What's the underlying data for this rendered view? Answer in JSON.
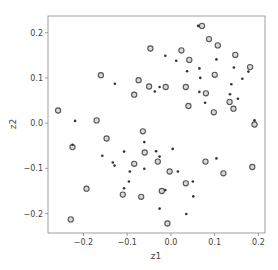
{
  "chart_data": {
    "type": "scatter",
    "title": "",
    "xlabel": "z1",
    "ylabel": "z2",
    "xlim": [
      -0.281,
      0.215
    ],
    "ylim": [
      -0.243,
      0.237
    ],
    "grid": false,
    "legend": null,
    "xticks": [
      -0.2,
      -0.1,
      0.0,
      0.1,
      0.2
    ],
    "xtick_labels": [
      "−0.2",
      "−0.1",
      "0.0",
      "0.1",
      "0.2"
    ],
    "yticks": [
      -0.2,
      -0.1,
      0.0,
      0.1,
      0.2
    ],
    "ytick_labels": [
      "−0.2",
      "−0.1",
      "0.0",
      "0.1",
      "0.2"
    ],
    "series": [
      {
        "name": "open-circles",
        "marker": "o",
        "style": "hollow",
        "points": [
          [
            -0.258,
            0.028
          ],
          [
            -0.16,
            0.106
          ],
          [
            -0.17,
            0.006
          ],
          [
            -0.147,
            -0.034
          ],
          [
            -0.225,
            -0.053
          ],
          [
            -0.193,
            -0.145
          ],
          [
            -0.229,
            -0.213
          ],
          [
            -0.084,
            0.063
          ],
          [
            -0.074,
            0.095
          ],
          [
            -0.05,
            0.081
          ],
          [
            -0.047,
            0.165
          ],
          [
            -0.012,
            0.08
          ],
          [
            -0.064,
            -0.018
          ],
          [
            -0.06,
            -0.065
          ],
          [
            -0.084,
            -0.09
          ],
          [
            -0.03,
            -0.085
          ],
          [
            -0.003,
            -0.107
          ],
          [
            -0.021,
            -0.15
          ],
          [
            -0.068,
            -0.163
          ],
          [
            -0.11,
            -0.158
          ],
          [
            -0.008,
            -0.222
          ],
          [
            0.024,
            0.161
          ],
          [
            0.034,
            0.08
          ],
          [
            0.042,
            0.14
          ],
          [
            0.04,
            0.038
          ],
          [
            0.034,
            -0.133
          ],
          [
            0.071,
            0.215
          ],
          [
            0.087,
            0.186
          ],
          [
            0.107,
            0.172
          ],
          [
            0.08,
            0.066
          ],
          [
            0.1,
            0.107
          ],
          [
            0.098,
            0.024
          ],
          [
            0.134,
            0.047
          ],
          [
            0.143,
            0.032
          ],
          [
            0.147,
            0.151
          ],
          [
            0.181,
            0.124
          ],
          [
            0.191,
            -0.003
          ],
          [
            0.186,
            -0.097
          ],
          [
            0.12,
            -0.111
          ],
          [
            0.079,
            -0.085
          ]
        ]
      },
      {
        "name": "filled-dots",
        "marker": ".",
        "style": "filled",
        "points": [
          [
            -0.219,
            0.005
          ],
          [
            -0.225,
            -0.048
          ],
          [
            -0.157,
            -0.072
          ],
          [
            -0.133,
            -0.087
          ],
          [
            -0.129,
            -0.094
          ],
          [
            -0.128,
            0.087
          ],
          [
            -0.107,
            -0.063
          ],
          [
            -0.094,
            -0.107
          ],
          [
            -0.096,
            -0.129
          ],
          [
            -0.107,
            -0.144
          ],
          [
            -0.061,
            -0.042
          ],
          [
            -0.061,
            -0.101
          ],
          [
            -0.037,
            0.07
          ],
          [
            -0.026,
            0.08
          ],
          [
            -0.034,
            -0.062
          ],
          [
            -0.026,
            -0.074
          ],
          [
            -0.013,
            0.149
          ],
          [
            0.012,
            0.138
          ],
          [
            0.004,
            -0.057
          ],
          [
            0.016,
            -0.107
          ],
          [
            -0.013,
            -0.148
          ],
          [
            -0.026,
            -0.189
          ],
          [
            0.035,
            -0.201
          ],
          [
            0.05,
            -0.129
          ],
          [
            0.051,
            -0.162
          ],
          [
            0.037,
            0.115
          ],
          [
            0.065,
            0.121
          ],
          [
            0.067,
            0.1
          ],
          [
            0.065,
            0.069
          ],
          [
            0.078,
            0.045
          ],
          [
            0.062,
            0.215
          ],
          [
            0.104,
            0.141
          ],
          [
            0.104,
            -0.078
          ],
          [
            0.144,
            0.123
          ],
          [
            0.138,
            0.086
          ],
          [
            0.135,
            0.064
          ],
          [
            0.153,
            0.054
          ],
          [
            0.163,
            0.098
          ],
          [
            0.177,
            0.114
          ],
          [
            0.191,
            0.006
          ]
        ]
      }
    ]
  }
}
